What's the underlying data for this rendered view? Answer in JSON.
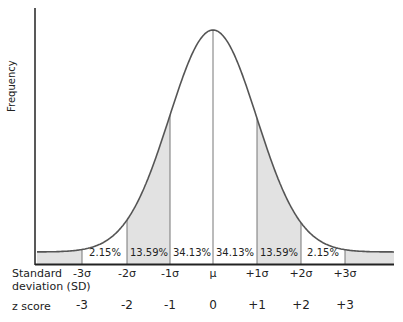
{
  "chart_data": {
    "type": "area",
    "title": "",
    "ylabel": "Frequency",
    "xlabel": "",
    "distribution": "normal",
    "sd_row_label": "Standard deviation (SD)",
    "z_row_label": "z score",
    "sd_ticks": [
      "-3σ",
      "-2σ",
      "-1σ",
      "μ",
      "+1σ",
      "+2σ",
      "+3σ"
    ],
    "z_ticks": [
      "-3",
      "-2",
      "-1",
      "0",
      "+1",
      "+2",
      "+3"
    ],
    "segments": [
      {
        "range": [
          "-3σ",
          "-2σ"
        ],
        "percent": "2.15%",
        "shaded": false
      },
      {
        "range": [
          "-2σ",
          "-1σ"
        ],
        "percent": "13.59%",
        "shaded": true
      },
      {
        "range": [
          "-1σ",
          "μ"
        ],
        "percent": "34.13%",
        "shaded": false
      },
      {
        "range": [
          "μ",
          "+1σ"
        ],
        "percent": "34.13%",
        "shaded": false
      },
      {
        "range": [
          "+1σ",
          "+2σ"
        ],
        "percent": "13.59%",
        "shaded": true
      },
      {
        "range": [
          "+2σ",
          "+3σ"
        ],
        "percent": "2.15%",
        "shaded": false
      }
    ],
    "tails_shaded": true,
    "grid": false,
    "legend": "none"
  },
  "colors": {
    "curve": "#555555",
    "shade": "#e2e2e2",
    "axis": "#222222",
    "divider": "#777777"
  },
  "labels": {
    "y_axis": "Frequency",
    "sd_line1": "Standard",
    "sd_line2": "deviation (SD)",
    "z_score": "z score"
  }
}
